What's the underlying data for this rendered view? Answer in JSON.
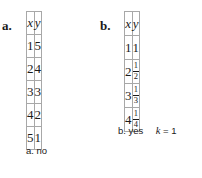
{
  "figure": {
    "parts": [
      {
        "id": "a",
        "label": "a.",
        "table": {
          "headers": [
            "x",
            "y"
          ],
          "rows": [
            [
              "1",
              "5"
            ],
            [
              "2",
              "4"
            ],
            [
              "3",
              "3"
            ],
            [
              "4",
              "2"
            ],
            [
              "5",
              "1"
            ]
          ]
        },
        "answer": {
          "prefix": "a.",
          "verdict": "no",
          "constant_symbol": "",
          "constant_equals": "",
          "constant_value": ""
        }
      },
      {
        "id": "b",
        "label": "b.",
        "table": {
          "headers": [
            "x",
            "y"
          ],
          "rows": [
            [
              "1",
              {
                "numerator": "1",
                "denominator": "1",
                "whole": "1"
              }
            ],
            [
              "2",
              {
                "numerator": "1",
                "denominator": "2"
              }
            ],
            [
              "3",
              {
                "numerator": "1",
                "denominator": "3"
              }
            ],
            [
              "4",
              {
                "numerator": "1",
                "denominator": "4"
              }
            ]
          ]
        },
        "answer": {
          "prefix": "b.",
          "verdict": "yes",
          "constant_symbol": "k",
          "constant_equals": "=",
          "constant_value": "1"
        }
      }
    ],
    "colors": {
      "background": "#ffffff",
      "text": "#1a1a1a",
      "table_border": "#a8a8a8"
    }
  }
}
